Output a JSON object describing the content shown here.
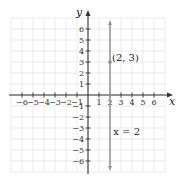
{
  "chart_data": {
    "type": "line",
    "title": "",
    "xlabel": "x",
    "ylabel": "y",
    "xlim": [
      -7,
      7
    ],
    "ylim": [
      -7,
      7
    ],
    "grid": true,
    "x_ticks": [
      -6,
      -5,
      -4,
      -3,
      -2,
      -1,
      1,
      2,
      3,
      4,
      5,
      6
    ],
    "y_ticks": [
      -6,
      -5,
      -4,
      -3,
      -2,
      -1,
      1,
      2,
      3,
      4,
      5,
      6
    ],
    "x_tick_labels": [
      "−6",
      "−5",
      "−4",
      "−3",
      "−2",
      "−1",
      "1",
      "2",
      "3",
      "4",
      "5",
      "6"
    ],
    "y_tick_labels": [
      "−6",
      "−5",
      "−4",
      "−3",
      "−2",
      "−1",
      "1",
      "2",
      "3",
      "4",
      "5",
      "6"
    ],
    "series": [
      {
        "name": "x = 2",
        "kind": "vertical-line",
        "x": 2,
        "y_range": [
          -7,
          7
        ],
        "color": "#999999",
        "arrows": "both"
      }
    ],
    "points": [
      {
        "x": 2,
        "y": 3,
        "label": "(2, 3)"
      }
    ],
    "annotations": [
      {
        "text": "x = 2",
        "x": 2.3,
        "y": -3.6
      }
    ],
    "axis_color": "#333333",
    "grid_color": "#e6e6e6"
  }
}
